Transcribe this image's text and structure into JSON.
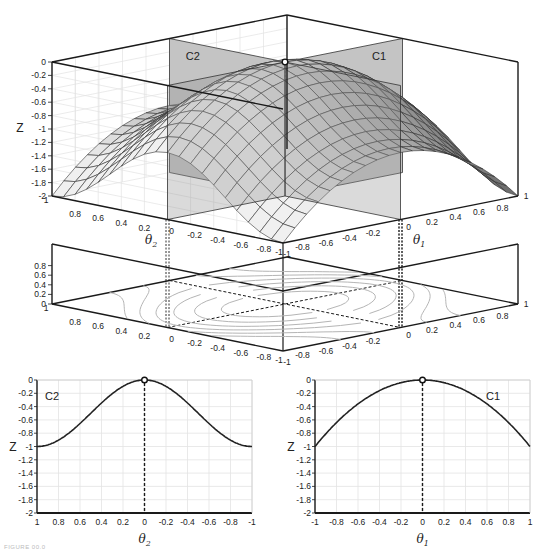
{
  "figure": {
    "caption": "FIGURE 00.0",
    "colors": {
      "axis": "#1a1a1a",
      "grid": "#e3e3e3",
      "plane": "#9a9a9a",
      "plane_light": "#c4c4c4",
      "surface_light": "#f0f0f0",
      "surface_dark": "#555555",
      "contour": "#b5b5b5",
      "curve": "#222222"
    }
  },
  "chart_data": [
    {
      "id": "surface3d",
      "type": "surface",
      "title": "",
      "xlabel": "θ1",
      "ylabel": "θ2",
      "zlabel": "Z",
      "x_ticks": [
        "-1",
        "-0.8",
        "-0.6",
        "-0.4",
        "-0.2",
        "0",
        "0.2",
        "0.4",
        "0.6",
        "0.8",
        "1"
      ],
      "y_ticks": [
        "1",
        "0.8",
        "0.6",
        "0.4",
        "0.2",
        "0",
        "-0.2",
        "-0.4",
        "-0.6",
        "-0.8",
        "-1"
      ],
      "z_ticks": [
        "0",
        "-0.2",
        "-0.4",
        "-0.6",
        "-0.8",
        "-1",
        "-1.2",
        "-1.4",
        "-1.6",
        "-1.8",
        "-2"
      ],
      "zlim": [
        -2,
        0
      ],
      "xlim": [
        -1,
        1
      ],
      "ylim": [
        -1,
        1
      ],
      "planes": [
        {
          "label": "C1",
          "description": "slice at θ2 = 0"
        },
        {
          "label": "C2",
          "description": "slice at θ1 = 0"
        }
      ],
      "maximum_point": {
        "theta1": 0,
        "theta2": 0,
        "z": 0
      },
      "grid": true
    },
    {
      "id": "contour",
      "type": "contour",
      "xlabel": "θ1",
      "ylabel": "θ2",
      "z_ticks": [
        "0",
        "0.2",
        "0.4",
        "0.6",
        "0.8",
        "1"
      ],
      "x_ticks": [
        "-1",
        "-0.8",
        "-0.6",
        "-0.4",
        "-0.2",
        "0",
        "0.2",
        "0.4",
        "0.6",
        "0.8",
        "1"
      ],
      "y_ticks": [
        "1",
        "0.8",
        "0.6",
        "0.4",
        "0.2",
        "0",
        "-0.2",
        "-0.4",
        "-0.6",
        "-0.8",
        "-1"
      ],
      "grid": false
    },
    {
      "id": "C2",
      "type": "line",
      "title": "C2",
      "xlabel": "θ2",
      "ylabel": "Z",
      "x": [
        1,
        0.8,
        0.6,
        0.4,
        0.2,
        0,
        -0.2,
        -0.4,
        -0.6,
        -0.8,
        -1
      ],
      "series": [
        {
          "name": "C2",
          "values": [
            -1.0,
            -0.96,
            -0.84,
            -0.65,
            -0.36,
            0.0,
            -0.36,
            -0.65,
            -0.84,
            -0.96,
            -1.0
          ]
        }
      ],
      "x_ticks": [
        "1",
        "0.8",
        "0.6",
        "0.4",
        "0.2",
        "0",
        "-0.2",
        "-0.4",
        "-0.6",
        "-0.8",
        "-1"
      ],
      "y_ticks": [
        "0",
        "-0.2",
        "-0.4",
        "-0.6",
        "-0.8",
        "-1",
        "-1.2",
        "-1.4",
        "-1.6",
        "-1.8",
        "-2"
      ],
      "xlim": [
        1,
        -1
      ],
      "ylim": [
        -2,
        0
      ],
      "marker": {
        "x": 0,
        "y": 0,
        "style": "open-circle"
      },
      "vline": {
        "x": 0,
        "style": "dashed"
      },
      "grid": true
    },
    {
      "id": "C1",
      "type": "line",
      "title": "C1",
      "xlabel": "θ1",
      "ylabel": "Z",
      "x": [
        -1,
        -0.8,
        -0.6,
        -0.4,
        -0.2,
        0,
        0.2,
        0.4,
        0.6,
        0.8,
        1
      ],
      "series": [
        {
          "name": "C1",
          "values": [
            -1.0,
            -0.64,
            -0.36,
            -0.16,
            -0.04,
            0.0,
            -0.04,
            -0.16,
            -0.36,
            -0.64,
            -1.0
          ]
        }
      ],
      "x_ticks": [
        "-1",
        "-0.8",
        "-0.6",
        "-0.4",
        "-0.2",
        "0",
        "0.2",
        "0.4",
        "0.6",
        "0.8",
        "1"
      ],
      "y_ticks": [
        "0",
        "-0.2",
        "-0.4",
        "-0.6",
        "-0.8",
        "-1",
        "-1.2",
        "-1.4",
        "-1.6",
        "-1.8",
        "-2"
      ],
      "xlim": [
        -1,
        1
      ],
      "ylim": [
        -2,
        0
      ],
      "marker": {
        "x": 0,
        "y": 0,
        "style": "open-circle"
      },
      "vline": {
        "x": 0,
        "style": "dashed"
      },
      "grid": true
    }
  ],
  "labels": {
    "z": "Z",
    "theta": "θ",
    "sub1": "1",
    "sub2": "2",
    "c1": "C1",
    "c2": "C2"
  }
}
